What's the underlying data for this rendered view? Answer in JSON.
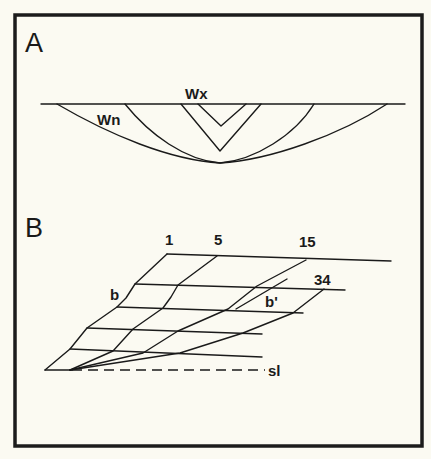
{
  "figure": {
    "background": "#fbfaf2",
    "ink": "#1a1a1a",
    "panels": [
      {
        "id": "A",
        "letter": "A",
        "labels": {
          "wx": "Wx",
          "wn": "Wn"
        },
        "description": "Cross-section of nested channel profiles below a horizontal surface: two inner V-shaped profiles and two outer curved profiles converging at a common bottom point"
      },
      {
        "id": "B",
        "letter": "B",
        "labels": {
          "iso_1": "1",
          "iso_5": "5",
          "iso_15": "15",
          "iso_34": "34",
          "b": "b",
          "b_prime": "b'",
          "sl": "sl"
        },
        "description": "Stacked horizontal lines crossed by oblique lines numbered 1, 5, 15, 34 converging toward a dashed baseline labeled sl"
      }
    ]
  }
}
